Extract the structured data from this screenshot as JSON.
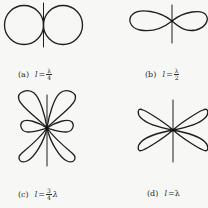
{
  "figure": {
    "stroke_color": "#1e1e1e",
    "background": "#f7f7f5",
    "panels": [
      {
        "id": "a",
        "tag": "(a)",
        "variable": "l",
        "equals": "=",
        "numerator": "λ",
        "denominator": "4",
        "suffix": "",
        "pattern": "two touching circles (broadside pattern)"
      },
      {
        "id": "b",
        "tag": "(b)",
        "variable": "l",
        "equals": "=",
        "numerator": "λ",
        "denominator": "2",
        "suffix": "",
        "pattern": "figure-eight, flattened horizontal lobes"
      },
      {
        "id": "c",
        "tag": "(c)",
        "variable": "l",
        "equals": "=",
        "numerator": "3",
        "denominator": "4",
        "suffix": "λ",
        "pattern": "four large diagonal lobes plus two small horizontal side lobes"
      },
      {
        "id": "d",
        "tag": "(d)",
        "variable": "l",
        "equals": "=λ",
        "numerator": "",
        "denominator": "",
        "suffix": "",
        "pattern": "four diagonal lobes (X shape)"
      }
    ]
  }
}
